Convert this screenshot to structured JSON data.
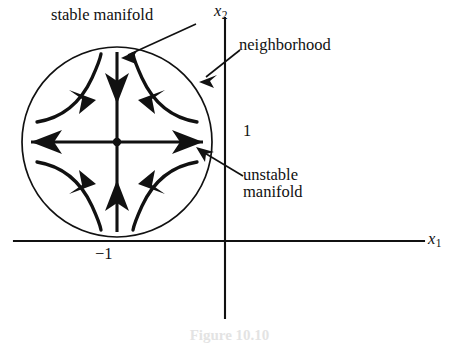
{
  "figure": {
    "domain": "diagram",
    "background_color": "#ffffff",
    "ink_color": "#111111",
    "caption_partial": "Figure 10.10"
  },
  "axes": {
    "x_axis": {
      "label": "x",
      "subscript": "1",
      "y_position": 241,
      "x_start": 14,
      "x_end": 424
    },
    "y_axis": {
      "label": "x",
      "subscript": "2",
      "x_position": 225,
      "y_start": 18,
      "y_end": 318
    },
    "ticks": [
      {
        "name": "y-tick-one",
        "text": "1",
        "axis": "x2",
        "value": 1
      },
      {
        "name": "x-tick-minus-one",
        "text": "−1",
        "axis": "x1",
        "value": -1
      }
    ]
  },
  "neighborhood_circle": {
    "center_x": 117,
    "center_y": 142,
    "radius": 95,
    "stroke_width": 1.7
  },
  "fixed_point": {
    "name": "saddle-equilibrium",
    "x": 117,
    "y": 142,
    "radius": 4.2
  },
  "manifolds": {
    "stable": {
      "name": "stable-manifold",
      "orientation": "vertical",
      "flow": "inward",
      "arrow_count": 2
    },
    "unstable": {
      "name": "unstable-manifold",
      "orientation": "horizontal",
      "flow": "outward",
      "arrow_count": 2
    }
  },
  "trajectories": {
    "count": 4,
    "description": "hyperbolic saddle flow curves, one per quadrant"
  },
  "labels": {
    "stable_manifold": "stable manifold",
    "neighborhood": "neighborhood",
    "unstable_manifold_line1": "unstable",
    "unstable_manifold_line2": "manifold",
    "tick_one": "1",
    "tick_minus_one": "−1",
    "axis_x_base": "x",
    "axis_x1_sub": "1",
    "axis_x2_sub": "2"
  },
  "leader_lines": [
    {
      "name": "leader-stable-manifold",
      "from_x": 196,
      "from_y": 24,
      "to_x": 122,
      "to_y": 58
    },
    {
      "name": "leader-neighborhood",
      "from_x": 238,
      "from_y": 50,
      "to_x": 199,
      "to_y": 80
    },
    {
      "name": "leader-unstable-manifold",
      "from_x": 242,
      "from_y": 175,
      "to_x": 196,
      "to_y": 148
    }
  ]
}
